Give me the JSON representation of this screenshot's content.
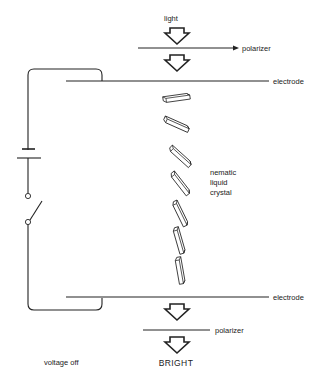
{
  "diagram": {
    "labels": {
      "light": "light",
      "polarizer_top": "polarizer",
      "electrode_top": "electrode",
      "liquid_crystal_line1": "nematic",
      "liquid_crystal_line2": "liquid",
      "liquid_crystal_line3": "crystal",
      "electrode_bottom": "electrode",
      "polarizer_bottom": "polarizer",
      "state": "voltage off",
      "result": "BRIGHT"
    },
    "colors": {
      "line": "#222222",
      "background": "#ffffff"
    },
    "molecules": [
      {
        "cx": 176,
        "cy": 98,
        "angle": -8
      },
      {
        "cx": 176,
        "cy": 124,
        "angle": 22
      },
      {
        "cx": 180,
        "cy": 156,
        "angle": 40
      },
      {
        "cx": 180,
        "cy": 182,
        "angle": 52
      },
      {
        "cx": 180,
        "cy": 212,
        "angle": 64
      },
      {
        "cx": 178,
        "cy": 240,
        "angle": 74
      },
      {
        "cx": 180,
        "cy": 269,
        "angle": 82
      }
    ]
  }
}
